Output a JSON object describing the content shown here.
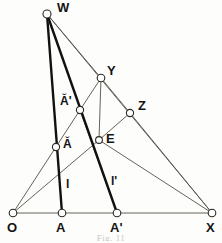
{
  "figure": {
    "kind": "geometry-construction-diagram",
    "caption": "Fig. 11",
    "background_color": "#fdfdfb",
    "thin_stroke_color": "#555047",
    "thick_stroke_color": "#111111",
    "node_fill_color": "#ffffff",
    "label_color": "#141414",
    "vertices": [
      {
        "id": "W",
        "label": "W",
        "x": 47,
        "y": 14,
        "r": 4.0,
        "label_x": 57,
        "label_y": 1,
        "size": "lbl-big"
      },
      {
        "id": "Y",
        "label": "Y",
        "x": 101,
        "y": 78,
        "r": 3.8,
        "label_x": 107,
        "label_y": 64,
        "size": "lbl-big"
      },
      {
        "id": "Z",
        "label": "Z",
        "x": 130,
        "y": 113,
        "r": 3.6,
        "label_x": 138,
        "label_y": 99,
        "size": "lbl-big"
      },
      {
        "id": "Abreve_prime",
        "label": "Ă'",
        "x": 80,
        "y": 110,
        "r": 3.6,
        "label_x": 60,
        "label_y": 95,
        "size": "lbl-mid"
      },
      {
        "id": "E",
        "label": "E",
        "x": 99,
        "y": 140,
        "r": 3.4,
        "label_x": 106,
        "label_y": 132,
        "size": "lbl-big"
      },
      {
        "id": "Abreve",
        "label": "Ă",
        "x": 56,
        "y": 147,
        "r": 3.6,
        "label_x": 63,
        "label_y": 138,
        "size": "lbl-mid"
      },
      {
        "id": "O",
        "label": "O",
        "x": 13,
        "y": 213,
        "r": 3.8,
        "label_x": 7,
        "label_y": 221,
        "size": "lbl-big"
      },
      {
        "id": "A",
        "label": "A",
        "x": 62,
        "y": 213,
        "r": 3.8,
        "label_x": 56,
        "label_y": 221,
        "size": "lbl-big"
      },
      {
        "id": "A_prime",
        "label": "A'",
        "x": 117,
        "y": 213,
        "r": 3.8,
        "label_x": 110,
        "label_y": 221,
        "size": "lbl-big"
      },
      {
        "id": "X",
        "label": "X",
        "x": 212,
        "y": 213,
        "r": 3.8,
        "label_x": 206,
        "label_y": 221,
        "size": "lbl-big"
      }
    ],
    "free_labels": [
      {
        "id": "l",
        "label": "l",
        "x": 66,
        "y": 178,
        "size": "lbl-mid"
      },
      {
        "id": "l_prime",
        "label": "l'",
        "x": 111,
        "y": 175,
        "size": "lbl-mid"
      }
    ],
    "segments_thin": [
      {
        "id": "baseline-O-X",
        "x1": 13,
        "y1": 213,
        "x2": 212,
        "y2": 213
      },
      {
        "id": "W-X",
        "x1": 47,
        "y1": 14,
        "x2": 212,
        "y2": 213
      },
      {
        "id": "W-Y",
        "x1": 47,
        "y1": 14,
        "x2": 101,
        "y2": 78
      },
      {
        "id": "O-Abreve-prime",
        "x1": 13,
        "y1": 213,
        "x2": 80,
        "y2": 110
      },
      {
        "id": "Abreve-prime-Y",
        "x1": 80,
        "y1": 110,
        "x2": 101,
        "y2": 78
      },
      {
        "id": "Y-Z",
        "x1": 101,
        "y1": 78,
        "x2": 130,
        "y2": 113
      },
      {
        "id": "Y-E",
        "x1": 101,
        "y1": 78,
        "x2": 99,
        "y2": 140
      },
      {
        "id": "Z-X",
        "x1": 130,
        "y1": 113,
        "x2": 212,
        "y2": 213
      },
      {
        "id": "Z-E",
        "x1": 130,
        "y1": 113,
        "x2": 99,
        "y2": 140
      },
      {
        "id": "E-X",
        "x1": 99,
        "y1": 140,
        "x2": 212,
        "y2": 213
      },
      {
        "id": "O-Abreve-E",
        "x1": 13,
        "y1": 213,
        "x2": 99,
        "y2": 140
      },
      {
        "id": "Abreve-prime-Aprime",
        "x1": 80,
        "y1": 110,
        "x2": 117,
        "y2": 213
      }
    ],
    "segments_thick": [
      {
        "id": "line-l-W-A",
        "x1": 47,
        "y1": 14,
        "x2": 62,
        "y2": 213
      },
      {
        "id": "line-lprime-W-Aprime",
        "x1": 47,
        "y1": 14,
        "x2": 117,
        "y2": 213
      }
    ]
  }
}
